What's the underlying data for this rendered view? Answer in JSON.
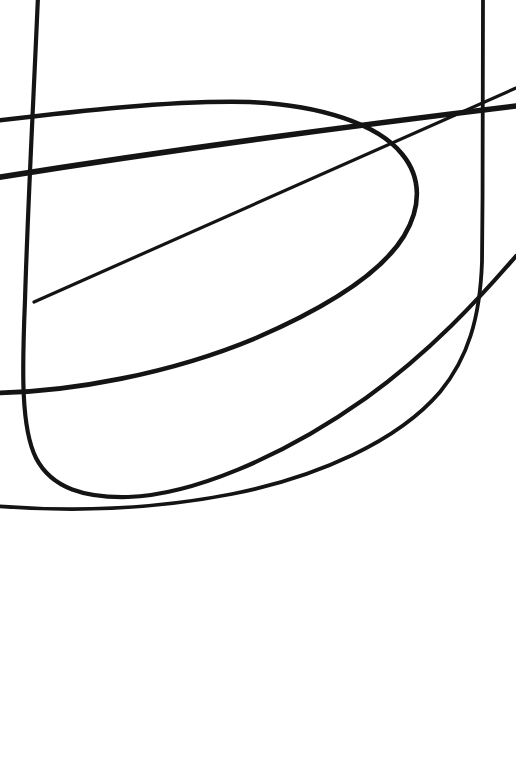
{
  "canvas": {
    "width": 516,
    "height": 782,
    "background_color": "#ffffff",
    "ink_color": "#141414",
    "description": "Abstract black-ink line drawing on white paper: four long sweeping curves and one straight stroke, all confined to the upper two thirds of the sheet, lower third blank."
  },
  "chart_data": {
    "type": "line",
    "title": "",
    "subtitle": "",
    "xlabel": "",
    "ylabel": "",
    "xlim": [
      0,
      516
    ],
    "ylim": [
      0,
      782
    ],
    "grid": false,
    "legend": "none",
    "annotations": [],
    "tick_labels_x": [],
    "tick_labels_y": [],
    "series": [
      {
        "name": "left-vertical-sweep",
        "stroke_width": 4.2,
        "color": "#141414",
        "note": "Near-vertical stroke entering at the top edge near x=38, drifting left to x=25 by y=400, then hooking right into a broad flat-bottomed bowl that bottoms out near y=497 and rises away to the right.",
        "path": "M 38 -4 C 34 90 28 200 25 300 C 22 372 21 428 36 458 C 52 489 86 498 128 497 C 190 495 280 459 366 398 C 430 352 478 300 516 256",
        "points": [
          [
            38,
            0
          ],
          [
            33,
            110
          ],
          [
            28,
            220
          ],
          [
            25,
            320
          ],
          [
            23,
            392
          ],
          [
            30,
            440
          ],
          [
            52,
            478
          ],
          [
            92,
            495
          ],
          [
            130,
            497
          ],
          [
            200,
            480
          ],
          [
            280,
            437
          ],
          [
            366,
            392
          ],
          [
            440,
            336
          ],
          [
            516,
            260
          ]
        ]
      },
      {
        "name": "right-vertical-sweep",
        "stroke_width": 3.8,
        "color": "#141414",
        "note": "Near-vertical stroke entering at the top edge near x=483, running straight down to about y=270, then bending left and flattening into a long descending sweep that exits the left edge near y=505.",
        "path": "M 483 -4 C 483 70 483 170 482 262 C 480 318 468 358 440 392 C 398 441 318 477 232 494 C 150 510 72 512 -4 506",
        "points": [
          [
            483,
            0
          ],
          [
            483,
            80
          ],
          [
            483,
            170
          ],
          [
            482,
            250
          ],
          [
            478,
            300
          ],
          [
            462,
            344
          ],
          [
            436,
            386
          ],
          [
            390,
            428
          ],
          [
            320,
            464
          ],
          [
            240,
            489
          ],
          [
            150,
            503
          ],
          [
            60,
            508
          ],
          [
            0,
            506
          ]
        ]
      },
      {
        "name": "leftward-opening-parabola",
        "stroke_width": 4.6,
        "color": "#141414",
        "note": "Large U rotated 90 degrees so it opens toward the left. Upper branch exits the left edge near y=120; the rounded nose sits near x=417, y=190; the lower branch exits the left edge near y=393.",
        "path": "M -6 121 C 70 112 170 100 250 102 C 320 105 378 124 402 154 C 422 178 421 208 404 236 C 382 272 330 306 256 338 C 170 374 70 392 -6 393",
        "points": [
          [
            0,
            120
          ],
          [
            60,
            113
          ],
          [
            130,
            105
          ],
          [
            200,
            101
          ],
          [
            260,
            103
          ],
          [
            320,
            112
          ],
          [
            372,
            134
          ],
          [
            404,
            166
          ],
          [
            412,
            196
          ],
          [
            398,
            228
          ],
          [
            360,
            262
          ],
          [
            300,
            298
          ],
          [
            230,
            330
          ],
          [
            150,
            360
          ],
          [
            70,
            382
          ],
          [
            0,
            393
          ]
        ]
      },
      {
        "name": "thin-straight-ascender",
        "stroke_width": 3.2,
        "color": "#141414",
        "note": "Thin straight stroke with a free blunt end at (34, 302) that climbs steadily to the right and exits the right edge near y=88.",
        "path": "M 34 302 L 516 88",
        "points": [
          [
            34,
            302
          ],
          [
            150,
            250
          ],
          [
            280,
            192
          ],
          [
            400,
            138
          ],
          [
            516,
            88
          ]
        ]
      },
      {
        "name": "thick-straight-ascender",
        "stroke_width": 5.6,
        "color": "#141414",
        "note": "Heaviest straight stroke of the set; enters the left edge near y=176, rises to the right with a slight upward bow and exits the right edge near y=108, thickening toward the right.",
        "path": "M -6 178 C 120 158 300 132 516 106",
        "points": [
          [
            0,
            176
          ],
          [
            90,
            163
          ],
          [
            190,
            149
          ],
          [
            300,
            134
          ],
          [
            410,
            120
          ],
          [
            516,
            107
          ]
        ]
      }
    ]
  },
  "viewer": {
    "zoom_label": "",
    "status_text": ""
  }
}
